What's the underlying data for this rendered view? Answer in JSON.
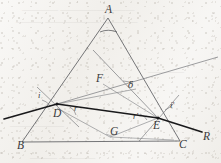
{
  "figure": {
    "background_color": "#f2f0ec",
    "line_color": "#55565a",
    "ray_color": "#1e1e20",
    "label_color": "#3a3a3c"
  },
  "vertices": [
    {
      "id": "A",
      "label": "A",
      "x": 108,
      "y": 10,
      "name": "prism-apex-a"
    },
    {
      "id": "B",
      "label": "B",
      "x": 20,
      "y": 146,
      "name": "prism-vertex-b"
    },
    {
      "id": "C",
      "label": "C",
      "x": 182,
      "y": 145,
      "name": "prism-vertex-c"
    },
    {
      "id": "D",
      "label": "D",
      "x": 56,
      "y": 110,
      "name": "entry-point-d"
    },
    {
      "id": "E",
      "label": "E",
      "x": 156,
      "y": 122,
      "name": "exit-point-e"
    },
    {
      "id": "F",
      "label": "F",
      "x": 99,
      "y": 79,
      "name": "intersection-point-f"
    },
    {
      "id": "G",
      "label": "G",
      "x": 113,
      "y": 132,
      "name": "intersection-point-g"
    },
    {
      "id": "R",
      "label": "R",
      "x": 206,
      "y": 138,
      "name": "emergent-ray-label-r"
    }
  ],
  "angles": [
    {
      "id": "i",
      "label": "i",
      "x": 40,
      "y": 96,
      "name": "angle-incidence-i",
      "kind": "latin"
    },
    {
      "id": "r",
      "label": "r",
      "x": 78,
      "y": 110,
      "name": "angle-refraction-r",
      "kind": "latin"
    },
    {
      "id": "rp",
      "label": "r'",
      "x": 136,
      "y": 118,
      "name": "angle-refraction-r-prime",
      "kind": "latin"
    },
    {
      "id": "ip",
      "label": "i'",
      "x": 172,
      "y": 108,
      "name": "angle-emergence-i-prime",
      "kind": "latin"
    },
    {
      "id": "delta",
      "label": "δ",
      "x": 130,
      "y": 85,
      "name": "angle-deviation-delta",
      "kind": "greek"
    }
  ],
  "geometry": {
    "prism_triangle": {
      "name": "prism-outline",
      "points": "108,18 22,142 180,141"
    },
    "incident_ray": {
      "name": "incident-ray-segment",
      "x1": 5,
      "y1": 118,
      "x2": 57,
      "y2": 104
    },
    "internal_ray": {
      "name": "internal-refracted-ray-de",
      "x1": 57,
      "y1": 104,
      "x2": 157,
      "y2": 118
    },
    "emergent_ray": {
      "name": "emergent-ray-er",
      "x1": 157,
      "y1": 118,
      "x2": 203,
      "y2": 133
    },
    "normal_at_d": {
      "name": "normal-line-at-d",
      "x1": 38,
      "y1": 88,
      "x2": 78,
      "y2": 126
    },
    "normal_at_e": {
      "name": "normal-line-at-e",
      "x1": 178,
      "y1": 96,
      "x2": 140,
      "y2": 140
    },
    "extension_incident": {
      "name": "incident-ray-extension-to-delta",
      "x1": 57,
      "y1": 104,
      "x2": 218,
      "y2": 58
    },
    "extension_emergent": {
      "name": "emergent-ray-backward-extension",
      "x1": 157,
      "y1": 118,
      "x2": 94,
      "y2": 52
    },
    "segment_df": {
      "name": "segment-d-to-f",
      "x1": 57,
      "y1": 104,
      "x2": 134,
      "y2": 90
    },
    "segment_fe": {
      "name": "segment-f-to-e",
      "x1": 104,
      "y1": 85,
      "x2": 157,
      "y2": 118
    },
    "segment_dg": {
      "name": "segment-d-to-g",
      "x1": 57,
      "y1": 108,
      "x2": 110,
      "y2": 137
    },
    "segment_ge": {
      "name": "segment-g-to-e",
      "x1": 110,
      "y1": 137,
      "x2": 157,
      "y2": 118
    },
    "segment_gc": {
      "name": "segment-g-to-bc",
      "x1": 110,
      "y1": 137,
      "x2": 173,
      "y2": 140
    },
    "apex_arc": {
      "name": "apex-angle-arc",
      "d": "M 100,32 Q 108,28 117,32"
    }
  }
}
